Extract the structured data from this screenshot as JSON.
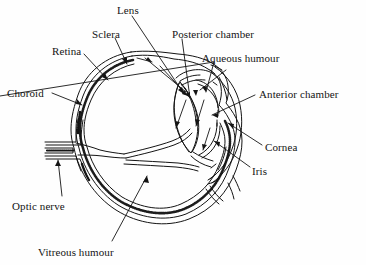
{
  "figure": {
    "background_color": "#fefefe",
    "ink_color": "#141414"
  },
  "labels": [
    {
      "id": "lens",
      "text": "Lens",
      "x": 117,
      "y": 4,
      "anchor": "left"
    },
    {
      "id": "sclera",
      "text": "Sclera",
      "x": 92,
      "y": 28,
      "anchor": "left"
    },
    {
      "id": "posterior_chamber",
      "text": "Posterior chamber",
      "x": 172,
      "y": 28,
      "anchor": "left"
    },
    {
      "id": "retina",
      "text": "Retina",
      "x": 52,
      "y": 45,
      "anchor": "left"
    },
    {
      "id": "aqueous_humour",
      "text": "Aqueous humour",
      "x": 202,
      "y": 52,
      "anchor": "left"
    },
    {
      "id": "choroid",
      "text": "Choroid",
      "x": 7,
      "y": 87,
      "anchor": "left"
    },
    {
      "id": "anterior_chamber",
      "text": "Anterior chamber",
      "x": 259,
      "y": 88,
      "anchor": "left"
    },
    {
      "id": "cornea",
      "text": "Cornea",
      "x": 265,
      "y": 141,
      "anchor": "left"
    },
    {
      "id": "iris",
      "text": "Iris",
      "x": 252,
      "y": 165,
      "anchor": "left"
    },
    {
      "id": "optic_nerve",
      "text": "Optic nerve",
      "x": 12,
      "y": 200,
      "anchor": "left"
    },
    {
      "id": "vitreous_humour",
      "text": "Vitreous humour",
      "x": 38,
      "y": 246,
      "anchor": "left"
    }
  ],
  "structures": [
    {
      "id": "sclera-layer",
      "name": "Sclera (outer white coat)"
    },
    {
      "id": "choroid-layer",
      "name": "Choroid (stippled middle coat)"
    },
    {
      "id": "retina-layer",
      "name": "Retina (inner coat)"
    },
    {
      "id": "cornea-body",
      "name": "Cornea (clear anterior bulge)"
    },
    {
      "id": "lens-body",
      "name": "Lens (biconvex)"
    },
    {
      "id": "iris-body",
      "name": "Iris"
    },
    {
      "id": "anterior-chamber",
      "name": "Anterior chamber"
    },
    {
      "id": "posterior-chamber",
      "name": "Posterior chamber"
    },
    {
      "id": "vitreous-cavity",
      "name": "Vitreous humour cavity"
    },
    {
      "id": "optic-nerve-stalk",
      "name": "Optic nerve stalk"
    }
  ]
}
